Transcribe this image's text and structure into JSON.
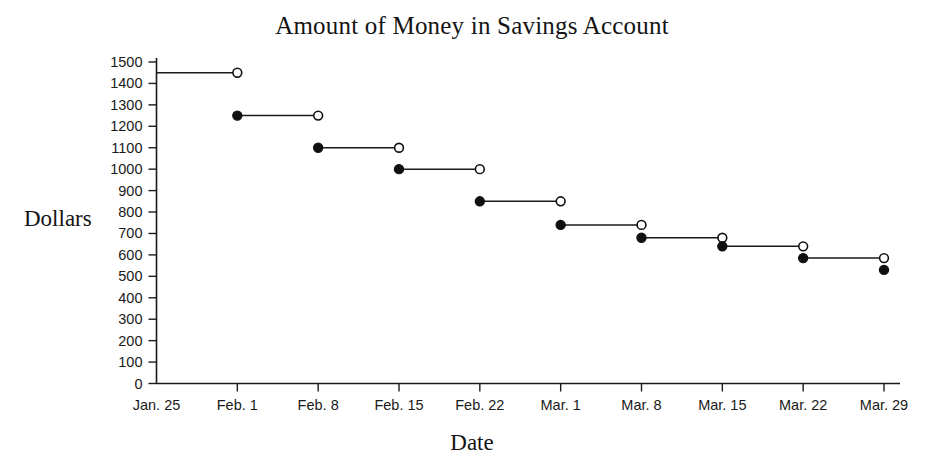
{
  "chart_data": {
    "type": "line",
    "title": "Amount of Money in Savings Account",
    "xlabel": "Date",
    "ylabel": "Dollars",
    "grid": false,
    "legend": null,
    "style_note": "step function; each segment closed (filled dot) on the left end and open (hollow dot) on the right end",
    "categories": [
      "Jan. 25",
      "Feb. 1",
      "Feb. 8",
      "Feb. 15",
      "Feb. 22",
      "Mar. 1",
      "Mar. 8",
      "Mar. 15",
      "Mar. 22",
      "Mar. 29"
    ],
    "x": [
      "Jan. 25",
      "Feb. 1",
      "Feb. 8",
      "Feb. 15",
      "Feb. 22",
      "Mar. 1",
      "Mar. 8",
      "Mar. 15",
      "Mar. 22",
      "Mar. 29"
    ],
    "values": [
      1450,
      1250,
      1100,
      1000,
      850,
      740,
      680,
      640,
      585,
      530
    ],
    "ylim": [
      0,
      1500
    ],
    "yticks": [
      0,
      100,
      200,
      300,
      400,
      500,
      600,
      700,
      800,
      900,
      1000,
      1100,
      1200,
      1300,
      1400,
      1500
    ],
    "ytick_labels": [
      "0",
      "100",
      "200",
      "300",
      "400",
      "500",
      "600",
      "700",
      "800",
      "900",
      "1000",
      "1100",
      "1200",
      "1300",
      "1400",
      "1500"
    ],
    "xtick_labels": [
      "Jan. 25",
      "Feb. 1",
      "Feb. 8",
      "Feb. 15",
      "Feb. 22",
      "Mar. 1",
      "Mar. 8",
      "Mar. 15",
      "Mar. 22",
      "Mar. 29"
    ],
    "segments": [
      {
        "x_start": "Jan. 25",
        "x_end": "Feb. 1",
        "value": 1450,
        "start_marker": "none",
        "end_marker": "open"
      },
      {
        "x_start": "Feb. 1",
        "x_end": "Feb. 8",
        "value": 1250,
        "start_marker": "closed",
        "end_marker": "open"
      },
      {
        "x_start": "Feb. 8",
        "x_end": "Feb. 15",
        "value": 1100,
        "start_marker": "closed",
        "end_marker": "open"
      },
      {
        "x_start": "Feb. 15",
        "x_end": "Feb. 22",
        "value": 1000,
        "start_marker": "closed",
        "end_marker": "open"
      },
      {
        "x_start": "Feb. 22",
        "x_end": "Mar. 1",
        "value": 850,
        "start_marker": "closed",
        "end_marker": "open"
      },
      {
        "x_start": "Mar. 1",
        "x_end": "Mar. 8",
        "value": 740,
        "start_marker": "closed",
        "end_marker": "open"
      },
      {
        "x_start": "Mar. 8",
        "x_end": "Mar. 15",
        "value": 680,
        "start_marker": "closed",
        "end_marker": "open"
      },
      {
        "x_start": "Mar. 15",
        "x_end": "Mar. 22",
        "value": 640,
        "start_marker": "closed",
        "end_marker": "open"
      },
      {
        "x_start": "Mar. 22",
        "x_end": "Mar. 29",
        "value": 585,
        "start_marker": "closed",
        "end_marker": "open"
      },
      {
        "x_start": "Mar. 29",
        "x_end": "Mar. 29",
        "value": 530,
        "start_marker": "closed",
        "end_marker": "none"
      }
    ],
    "colors": {
      "line": "#1a1a1a",
      "marker_fill_closed": "#101010",
      "marker_fill_open": "#ffffff",
      "axis": "#1a1a1a",
      "background": "#ffffff",
      "text": "#141414"
    }
  }
}
